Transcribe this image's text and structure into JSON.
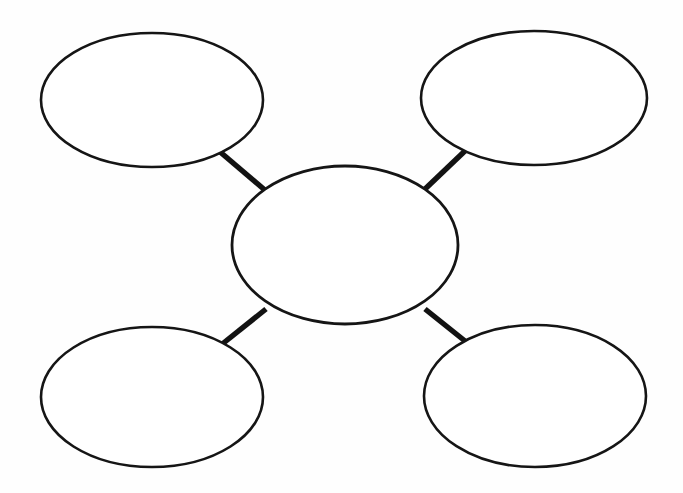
{
  "page": {
    "background_color": "#fefefe",
    "stroke_color": "#151515",
    "fill_color": "#ffffff",
    "width": 683,
    "height": 493
  },
  "diagram": {
    "type": "concept-map",
    "layout": "hub-and-spoke",
    "node_shape": "ellipse",
    "node_count": 5,
    "connector_count": 4,
    "center_node": {
      "id": "center",
      "label": "",
      "cx": 345,
      "cy": 245,
      "rx": 113,
      "ry": 79
    },
    "outer_nodes": [
      {
        "id": "top-left",
        "label": "",
        "cx": 152,
        "cy": 100,
        "rx": 111,
        "ry": 67
      },
      {
        "id": "top-right",
        "label": "",
        "cx": 534,
        "cy": 98,
        "rx": 113,
        "ry": 67
      },
      {
        "id": "bottom-left",
        "label": "",
        "cx": 152,
        "cy": 397,
        "rx": 111,
        "ry": 70
      },
      {
        "id": "bottom-right",
        "label": "",
        "cx": 535,
        "cy": 396,
        "rx": 111,
        "ry": 71
      }
    ],
    "connectors": [
      {
        "id": "connector-top-left",
        "from": "top-left",
        "to": "center",
        "x1": 219,
        "y1": 151,
        "x2": 266,
        "y2": 191
      },
      {
        "id": "connector-top-right",
        "from": "top-right",
        "to": "center",
        "x1": 467,
        "y1": 149,
        "x2": 424,
        "y2": 190
      },
      {
        "id": "connector-bottom-left",
        "from": "bottom-left",
        "to": "center",
        "x1": 221,
        "y1": 345,
        "x2": 266,
        "y2": 309
      },
      {
        "id": "connector-bottom-right",
        "from": "bottom-right",
        "to": "center",
        "x1": 470,
        "y1": 345,
        "x2": 425,
        "y2": 309
      }
    ]
  }
}
